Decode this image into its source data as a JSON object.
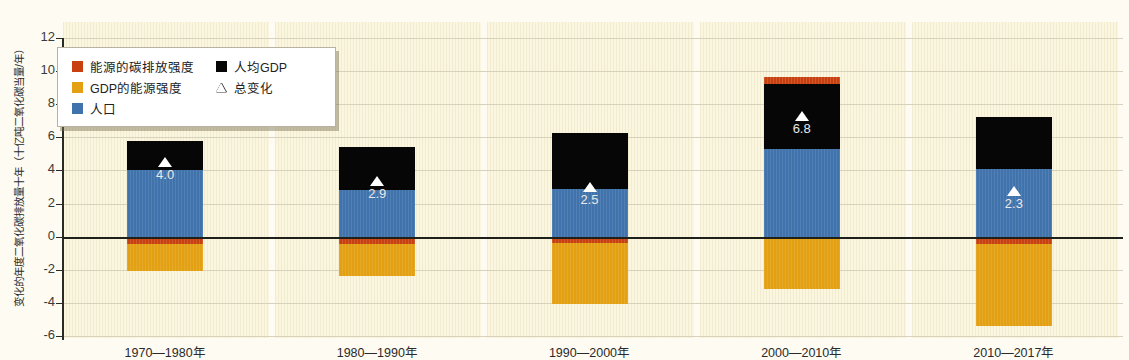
{
  "chart_data": {
    "type": "bar",
    "title": "",
    "ylabel": "变化的年度二氧化碳排放量十年（十亿吨二氧化碳当量/年）",
    "xlabel": "",
    "ylim": [
      -6,
      12
    ],
    "yticks": [
      12,
      10,
      8,
      6,
      4,
      2,
      0,
      -2,
      -4,
      -6
    ],
    "grid": true,
    "stacked": true,
    "legend_position": "top-left",
    "categories": [
      "1970—1980年",
      "1980—1990年",
      "1990—2000年",
      "2000—2010年",
      "2010—2017年"
    ],
    "series": [
      {
        "name": "能源的碳排放强度",
        "key": "carbon",
        "color": "#c8400f",
        "values": [
          -0.45,
          -0.45,
          -0.4,
          0.45,
          -0.45
        ]
      },
      {
        "name": "GDP的能源强度",
        "key": "energy",
        "color": "#e3a012",
        "values": [
          -1.6,
          -1.95,
          -3.65,
          -3.15,
          -4.95
        ]
      },
      {
        "name": "人口",
        "key": "pop",
        "color": "#4072ab",
        "values": [
          4.0,
          2.8,
          2.9,
          5.3,
          4.1
        ]
      },
      {
        "name": "人均GDP",
        "key": "gdp",
        "color": "#060606",
        "values": [
          1.75,
          2.6,
          3.35,
          3.9,
          3.1
        ]
      }
    ],
    "net_change": {
      "name": "总变化",
      "marker": "triangle",
      "values": [
        4.0,
        2.9,
        2.5,
        6.8,
        2.3
      ],
      "labels": [
        "4.0",
        "2.9",
        "2.5",
        "6.8",
        "2.3"
      ]
    },
    "bar_extents": [
      {
        "category": "1970—1980年",
        "top": 5.75,
        "bottom": -2.05
      },
      {
        "category": "1980—1990年",
        "top": 5.4,
        "bottom": -2.4
      },
      {
        "category": "1990—2000年",
        "top": 6.25,
        "bottom": -4.05
      },
      {
        "category": "2000—2010年",
        "top": 9.65,
        "bottom": -3.15
      },
      {
        "category": "2010—2017年",
        "top": 7.2,
        "bottom": -5.4
      }
    ]
  },
  "legend": {
    "left_items": [
      {
        "label": "能源的碳排放强度",
        "swatch": "carbon-swatch",
        "color": "#c8400f"
      },
      {
        "label": "GDP的能源强度",
        "swatch": "energy-swatch",
        "color": "#e3a012"
      },
      {
        "label": "人口",
        "swatch": "population-swatch",
        "color": "#4072ab"
      }
    ],
    "right_items": [
      {
        "label": "人均GDP",
        "swatch": "gdp-swatch",
        "color": "#060606"
      },
      {
        "label": "总变化",
        "swatch": "total-change-triangle-icon",
        "color": "#ffffff"
      }
    ]
  },
  "colors": {
    "background": "#fdfbf2",
    "panel": "#fbf6e0",
    "gridline": "#d8d2bc",
    "axis": "#20201a",
    "carbon_intensity": "#c8400f",
    "energy_intensity": "#e3a012",
    "population": "#4072ab",
    "gdp_per_capita": "#060606"
  }
}
